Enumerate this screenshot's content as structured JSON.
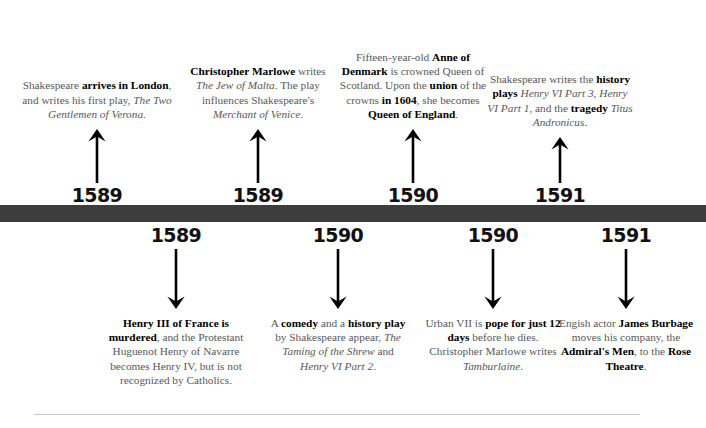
{
  "figure": {
    "type": "dual-sided historical timeline",
    "bar_color": "#3d3d3d",
    "text_color": "#58585a",
    "emphasis_color": "#000000",
    "rule_color": "#c9c9c9"
  },
  "events_above": [
    {
      "year": "1589",
      "arrow": "arrow-up-icon",
      "text_plain": "Shakespeare arrives in London, and writes his first play, The Two Gentlemen of Verona.",
      "segments": [
        {
          "t": "Shakespeare ",
          "style": "normal"
        },
        {
          "t": "arrives in London",
          "style": "bold"
        },
        {
          "t": ", and writes his first play, ",
          "style": "normal"
        },
        {
          "t": "The Two Gentlemen of Verona",
          "style": "italic"
        },
        {
          "t": ".",
          "style": "normal"
        }
      ]
    },
    {
      "year": "1589",
      "arrow": "arrow-up-icon",
      "text_plain": "Christopher Marlowe writes The Jew of Malta. The play influences Shakespeare's Merchant of Venice.",
      "segments": [
        {
          "t": "Christopher Marlowe",
          "style": "bold"
        },
        {
          "t": " writes ",
          "style": "normal"
        },
        {
          "t": "The Jew of Malta",
          "style": "italic"
        },
        {
          "t": ". The play influences Shakespeare's ",
          "style": "normal"
        },
        {
          "t": "Merchant of Venice",
          "style": "italic"
        },
        {
          "t": ".",
          "style": "normal"
        }
      ]
    },
    {
      "year": "1590",
      "arrow": "arrow-up-icon",
      "text_plain": "Fifteen-year-old Anne of Denmark is crowned Queen of Scotland. Upon the union of the crowns in 1604, she becomes Queen of England.",
      "segments": [
        {
          "t": "Fifteen-year-old ",
          "style": "normal"
        },
        {
          "t": "Anne of Denmark",
          "style": "bold"
        },
        {
          "t": " is crowned Queen of Scotland. Upon the ",
          "style": "normal"
        },
        {
          "t": "union",
          "style": "bold"
        },
        {
          "t": " of the crowns ",
          "style": "normal"
        },
        {
          "t": "in 1604",
          "style": "bold"
        },
        {
          "t": ", she becomes ",
          "style": "normal"
        },
        {
          "t": "Queen of England",
          "style": "bold"
        },
        {
          "t": ".",
          "style": "normal"
        }
      ]
    },
    {
      "year": "1591",
      "arrow": "arrow-up-icon",
      "text_plain": "Shakespeare writes the history plays Henry VI Part 3, Henry VI Part 1, and the tragedy Titus Andronicus.",
      "segments": [
        {
          "t": "Shakespeare writes the ",
          "style": "normal"
        },
        {
          "t": "history plays",
          "style": "bold"
        },
        {
          "t": " ",
          "style": "normal"
        },
        {
          "t": "Henry VI Part 3, Henry VI Part 1",
          "style": "italic"
        },
        {
          "t": ", and the ",
          "style": "normal"
        },
        {
          "t": "tragedy",
          "style": "bold"
        },
        {
          "t": " ",
          "style": "normal"
        },
        {
          "t": "Titus Andronicus",
          "style": "italic"
        },
        {
          "t": ".",
          "style": "normal"
        }
      ]
    }
  ],
  "events_below": [
    {
      "year": "1589",
      "arrow": "arrow-down-icon",
      "text_plain": "Henry III of France is murdered, and the Protestant Huguenot Henry of Navarre becomes Henry IV, but is not recognized by Catholics.",
      "segments": [
        {
          "t": "Henry III of France is murdered",
          "style": "bold"
        },
        {
          "t": ", and the Protestant Huguenot Henry of Navarre becomes Henry IV, but is not recognized by Catholics.",
          "style": "normal"
        }
      ]
    },
    {
      "year": "1590",
      "arrow": "arrow-down-icon",
      "text_plain": "A comedy and a history play by Shakespeare appear, The Taming of the Shrew and Henry VI Part 2.",
      "segments": [
        {
          "t": "A ",
          "style": "normal"
        },
        {
          "t": "comedy",
          "style": "bold"
        },
        {
          "t": " and a ",
          "style": "normal"
        },
        {
          "t": "history play",
          "style": "bold"
        },
        {
          "t": " by Shakespeare appear, ",
          "style": "normal"
        },
        {
          "t": "The Taming of the Shrew",
          "style": "italic"
        },
        {
          "t": " and ",
          "style": "normal"
        },
        {
          "t": "Henry VI Part 2",
          "style": "italic"
        },
        {
          "t": ".",
          "style": "normal"
        }
      ]
    },
    {
      "year": "1590",
      "arrow": "arrow-down-icon",
      "text_plain": "Urban VII is pope for just 12 days before he dies. Christopher Marlowe writes Tamburlaine.",
      "segments": [
        {
          "t": "Urban VII is ",
          "style": "normal"
        },
        {
          "t": "pope for just 12 days",
          "style": "bold"
        },
        {
          "t": " before he dies. Christopher Marlowe writes ",
          "style": "normal"
        },
        {
          "t": "Tamburlaine",
          "style": "italic"
        },
        {
          "t": ".",
          "style": "normal"
        }
      ]
    },
    {
      "year": "1591",
      "arrow": "arrow-down-icon",
      "text_plain": "Engish actor James Burbage moves his company, the Admiral's Men, to the Rose Theatre.",
      "segments": [
        {
          "t": "Engish actor ",
          "style": "normal"
        },
        {
          "t": "James Burbage",
          "style": "bold"
        },
        {
          "t": " moves his company, the ",
          "style": "normal"
        },
        {
          "t": "Admiral's Men",
          "style": "bold"
        },
        {
          "t": ", to the ",
          "style": "normal"
        },
        {
          "t": "Rose Theatre",
          "style": "bold"
        },
        {
          "t": ".",
          "style": "normal"
        }
      ]
    }
  ]
}
